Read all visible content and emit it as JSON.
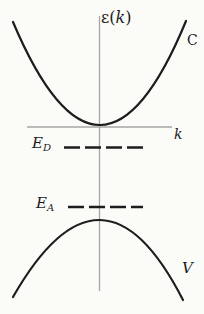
{
  "figure": {
    "kind": "semiconductor-band-structure-diagram",
    "y_axis_label": {
      "prefix": "ε(",
      "variable": "k",
      "suffix": ")"
    },
    "x_axis_label": "k",
    "conduction_band_label": "C",
    "valence_band_label": "V",
    "donor_level_label": {
      "base": "E",
      "subscript": "D"
    },
    "acceptor_level_label": {
      "base": "E",
      "subscript": "A"
    },
    "colors": {
      "background": "#fbfbf8",
      "curve": "#1d1d1d",
      "axis": "#a6a6a6",
      "text": "#1d1d1d"
    },
    "geometry": {
      "y_axis": "M 99.5 16 V 291",
      "x_axis": "M 27 127 H 172",
      "conduction_band": "M 13 22 Q 100.5 228.5 186 21",
      "valence_band": "M 13 297 Q 102 141.5 183 300",
      "donor_level": "M 64 147.5 H 143",
      "acceptor_level": "M 68 207 H 143"
    }
  }
}
